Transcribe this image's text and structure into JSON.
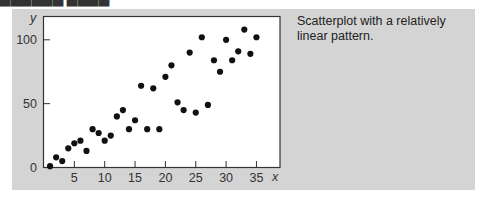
{
  "figure": {
    "caption": "Scatterplot with a relatively linear pattern."
  },
  "colors": {
    "panel": "#d4d4d4",
    "plot_bg": "#ffffff",
    "points": "#111111",
    "axis": "#333333"
  },
  "chart_data": {
    "type": "scatter",
    "title": "",
    "xlabel": "x",
    "ylabel": "y",
    "xlim": [
      0,
      39
    ],
    "ylim": [
      0,
      118
    ],
    "xticks": [
      5,
      10,
      15,
      20,
      25,
      30,
      35
    ],
    "yticks": [
      0,
      50,
      100
    ],
    "grid": false,
    "legend": null,
    "annotation": "Scatterplot with a relatively linear pattern.",
    "points": [
      {
        "x": 1,
        "y": 1
      },
      {
        "x": 2,
        "y": 8
      },
      {
        "x": 3,
        "y": 5
      },
      {
        "x": 4,
        "y": 15
      },
      {
        "x": 5,
        "y": 19
      },
      {
        "x": 6,
        "y": 21
      },
      {
        "x": 7,
        "y": 13
      },
      {
        "x": 8,
        "y": 30
      },
      {
        "x": 9,
        "y": 27
      },
      {
        "x": 10,
        "y": 21
      },
      {
        "x": 11,
        "y": 25
      },
      {
        "x": 12,
        "y": 40
      },
      {
        "x": 13,
        "y": 45
      },
      {
        "x": 14,
        "y": 30
      },
      {
        "x": 15,
        "y": 37
      },
      {
        "x": 16,
        "y": 64
      },
      {
        "x": 17,
        "y": 30
      },
      {
        "x": 18,
        "y": 62
      },
      {
        "x": 19,
        "y": 30
      },
      {
        "x": 20,
        "y": 71
      },
      {
        "x": 21,
        "y": 80
      },
      {
        "x": 22,
        "y": 51
      },
      {
        "x": 23,
        "y": 45
      },
      {
        "x": 24,
        "y": 90
      },
      {
        "x": 25,
        "y": 43
      },
      {
        "x": 26,
        "y": 102
      },
      {
        "x": 27,
        "y": 49
      },
      {
        "x": 28,
        "y": 84
      },
      {
        "x": 29,
        "y": 75
      },
      {
        "x": 30,
        "y": 100
      },
      {
        "x": 31,
        "y": 84
      },
      {
        "x": 32,
        "y": 91
      },
      {
        "x": 33,
        "y": 108
      },
      {
        "x": 34,
        "y": 89
      },
      {
        "x": 35,
        "y": 102
      }
    ]
  }
}
